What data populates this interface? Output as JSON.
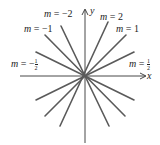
{
  "diagram": {
    "title": "",
    "axes": {
      "x_label": "x",
      "y_label": "y",
      "origin_px": [
        85,
        76
      ]
    },
    "lines": [
      {
        "slope": -2,
        "label_var": "m",
        "label_eq": "=",
        "label_value": "−2"
      },
      {
        "slope": -1,
        "label_var": "m",
        "label_eq": "=",
        "label_value": "−1"
      },
      {
        "slope": -0.5,
        "label_var": "m",
        "label_eq": "=",
        "label_value": "−",
        "label_num": "1",
        "label_den": "2"
      },
      {
        "slope": 2,
        "label_var": "m",
        "label_eq": "=",
        "label_value": "2"
      },
      {
        "slope": 1,
        "label_var": "m",
        "label_eq": "=",
        "label_value": "1"
      },
      {
        "slope": 0.5,
        "label_var": "m",
        "label_eq": "=",
        "label_value": "",
        "label_num": "1",
        "label_den": "2"
      }
    ],
    "colors": {
      "line": "#555555",
      "axis": "#333333",
      "text": "#222222"
    }
  }
}
